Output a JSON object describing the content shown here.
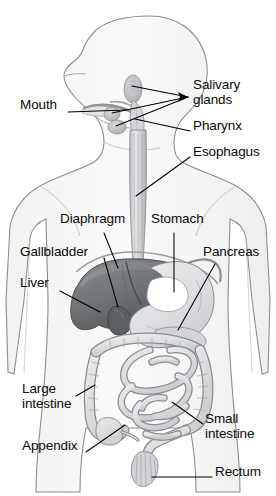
{
  "figure": {
    "kind": "anatomical-diagram",
    "view": "anterior torso with left-facing head profile",
    "style": "grayscale pencil / halftone medical illustration on white background",
    "colors": {
      "background": "#ffffff",
      "body_outline": "#8d8d8d",
      "body_fill": "#f7f7f7",
      "liver_dark": "#6f7276",
      "liver_shadow": "#55585c",
      "stomach_light": "#e3e4e6",
      "stomach_highlight": "#ffffff",
      "intestine_fill": "#dcdddf",
      "intestine_line": "#8a8d90",
      "esophagus_fill": "#d8d9db",
      "gland_fill": "#c9cacd",
      "label_text": "#0a0a0a",
      "leader_line": "#000000"
    }
  },
  "labels": [
    {
      "id": "mouth",
      "text": "Mouth",
      "lines": [
        "Mouth"
      ],
      "x": 20,
      "y": 105,
      "align": "left"
    },
    {
      "id": "salivary-glands",
      "text": "Salivary glands",
      "lines": [
        "Salivary",
        "glands"
      ],
      "x": 193,
      "y": 85,
      "align": "left"
    },
    {
      "id": "pharynx",
      "text": "Pharynx",
      "lines": [
        "Pharynx"
      ],
      "x": 193,
      "y": 126,
      "align": "left"
    },
    {
      "id": "esophagus",
      "text": "Esophagus",
      "lines": [
        "Esophagus"
      ],
      "x": 193,
      "y": 152,
      "align": "left"
    },
    {
      "id": "diaphragm",
      "text": "Diaphragm",
      "lines": [
        "Diaphragm"
      ],
      "x": 60,
      "y": 219,
      "align": "left"
    },
    {
      "id": "stomach",
      "text": "Stomach",
      "lines": [
        "Stomach"
      ],
      "x": 151,
      "y": 219,
      "align": "left"
    },
    {
      "id": "gallbladder",
      "text": "Gallbladder",
      "lines": [
        "Gallbladder"
      ],
      "x": 20,
      "y": 252,
      "align": "left"
    },
    {
      "id": "pancreas",
      "text": "Pancreas",
      "lines": [
        "Pancreas"
      ],
      "x": 203,
      "y": 252,
      "align": "left"
    },
    {
      "id": "liver",
      "text": "Liver",
      "lines": [
        "Liver"
      ],
      "x": 20,
      "y": 283,
      "align": "left"
    },
    {
      "id": "large-intestine",
      "text": "Large intestine",
      "lines": [
        "Large",
        "intestine"
      ],
      "x": 22,
      "y": 389,
      "align": "left"
    },
    {
      "id": "small-intestine",
      "text": "Small intestine",
      "lines": [
        "Small",
        "intestine"
      ],
      "x": 205,
      "y": 419,
      "align": "left"
    },
    {
      "id": "appendix",
      "text": "Appendix",
      "lines": [
        "Appendix"
      ],
      "x": 22,
      "y": 446,
      "align": "left"
    },
    {
      "id": "rectum",
      "text": "Rectum",
      "lines": [
        "Rectum"
      ],
      "x": 215,
      "y": 472,
      "align": "left"
    }
  ],
  "leader_lines": [
    {
      "id": "mouth-leader",
      "for": "mouth",
      "from": [
        68,
        112
      ],
      "to": [
        126,
        110
      ]
    },
    {
      "id": "salivary-upper-leader",
      "for": "salivary-glands",
      "from": [
        188,
        97
      ],
      "to": [
        132,
        86
      ]
    },
    {
      "id": "salivary-middle-leader",
      "for": "salivary-glands",
      "from": [
        188,
        97
      ],
      "to": [
        112,
        113
      ]
    },
    {
      "id": "salivary-lower-leader",
      "for": "salivary-glands",
      "from": [
        188,
        97
      ],
      "to": [
        116,
        126
      ]
    },
    {
      "id": "pharynx-leader",
      "for": "pharynx",
      "from": [
        190,
        131
      ],
      "to": [
        135,
        119
      ]
    },
    {
      "id": "esophagus-leader",
      "for": "esophagus",
      "from": [
        190,
        157
      ],
      "to": [
        136,
        196
      ]
    },
    {
      "id": "diaphragm-leader",
      "for": "diaphragm",
      "from": [
        104,
        233
      ],
      "to": [
        118,
        268
      ]
    },
    {
      "id": "stomach-leader",
      "for": "stomach",
      "from": [
        174,
        233
      ],
      "to": [
        174,
        292
      ]
    },
    {
      "id": "gallbladder-leader",
      "for": "gallbladder",
      "from": [
        104,
        258
      ],
      "to": [
        118,
        307
      ]
    },
    {
      "id": "pancreas-leader",
      "for": "pancreas",
      "from": [
        215,
        264
      ],
      "to": [
        178,
        330
      ]
    },
    {
      "id": "liver-leader",
      "for": "liver",
      "from": [
        60,
        291
      ],
      "to": [
        100,
        312
      ]
    },
    {
      "id": "large-intestine-leader",
      "for": "large-intestine",
      "from": [
        76,
        396
      ],
      "to": [
        95,
        385
      ]
    },
    {
      "id": "small-intestine-leader",
      "for": "small-intestine",
      "from": [
        203,
        424
      ],
      "to": [
        172,
        402
      ]
    },
    {
      "id": "appendix-leader",
      "for": "appendix",
      "from": [
        86,
        452
      ],
      "to": [
        125,
        425
      ]
    },
    {
      "id": "rectum-leader",
      "for": "rectum",
      "from": [
        212,
        477
      ],
      "to": [
        152,
        477
      ]
    }
  ],
  "organs": [
    {
      "id": "head-profile",
      "name": "head and neck profile"
    },
    {
      "id": "torso-outline",
      "name": "torso and arms outline"
    },
    {
      "id": "oral-cavity",
      "name": "mouth / oral cavity"
    },
    {
      "id": "salivary-gland-parotid",
      "name": "parotid salivary gland"
    },
    {
      "id": "salivary-gland-submandibular",
      "name": "submandibular salivary gland"
    },
    {
      "id": "salivary-gland-sublingual",
      "name": "sublingual salivary gland"
    },
    {
      "id": "pharynx-organ",
      "name": "pharynx"
    },
    {
      "id": "esophagus-organ",
      "name": "esophagus"
    },
    {
      "id": "diaphragm-organ",
      "name": "diaphragm"
    },
    {
      "id": "liver-organ",
      "name": "liver"
    },
    {
      "id": "gallbladder-organ",
      "name": "gallbladder"
    },
    {
      "id": "stomach-organ",
      "name": "stomach"
    },
    {
      "id": "pancreas-organ",
      "name": "pancreas"
    },
    {
      "id": "large-intestine-organ",
      "name": "large intestine / colon"
    },
    {
      "id": "small-intestine-organ",
      "name": "small intestine"
    },
    {
      "id": "appendix-organ",
      "name": "appendix"
    },
    {
      "id": "rectum-organ",
      "name": "rectum"
    }
  ]
}
